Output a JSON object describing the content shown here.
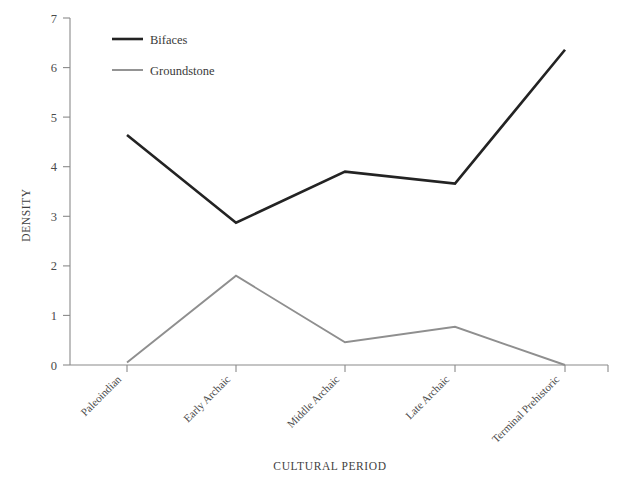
{
  "chart_data": {
    "type": "line",
    "title": "",
    "xlabel": "CULTURAL PERIOD",
    "ylabel": "DENSITY",
    "categories": [
      "Paleoindian",
      "Early Archaic",
      "Middle Archaic",
      "Late Archaic",
      "Terminal Prehistoric"
    ],
    "ylim": [
      0,
      7
    ],
    "yticks": [
      0,
      1,
      2,
      3,
      4,
      5,
      6,
      7
    ],
    "ytick_labels": [
      "0",
      "1",
      "2",
      "3",
      "4",
      "5",
      "6",
      "7"
    ],
    "grid": false,
    "legend_position": "top-left-inside",
    "series": [
      {
        "name": "Bifaces",
        "color": "#232323",
        "values": [
          4.64,
          2.87,
          3.9,
          3.66,
          6.36
        ]
      },
      {
        "name": "Groundstone",
        "color": "#8f8f8f",
        "values": [
          0.05,
          1.8,
          0.46,
          0.77,
          0.0
        ]
      }
    ]
  },
  "axes": {
    "y_title": "DENSITY",
    "x_title": "CULTURAL PERIOD"
  },
  "legend": {
    "entries": [
      {
        "label": "Bifaces",
        "swatch": "line-swatch-black"
      },
      {
        "label": "Groundstone",
        "swatch": "line-swatch-gray"
      }
    ]
  },
  "ticks": {
    "y": [
      "7",
      "6",
      "5",
      "4",
      "3",
      "2",
      "1",
      "0"
    ]
  }
}
